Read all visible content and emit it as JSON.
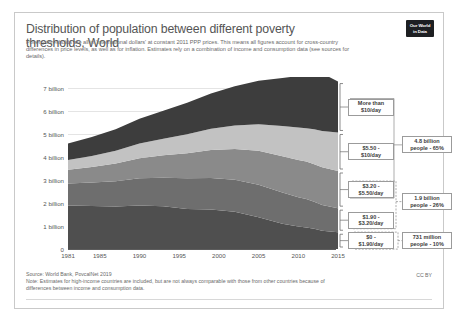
{
  "header": {
    "title": "Distribution of population between different poverty thresholds, World",
    "subtitle": "Poverty thresholds are all in 'international dollars' at constant 2011 PPP prices. This means all figures account for cross-country differences in price levels, as well as for inflation. Estimates rely on a combination of income and consumption data (see sources for details).",
    "logo_line1": "Our World",
    "logo_line2": "in Data"
  },
  "footer": {
    "source": "Source: World Bank, PovcalNet 2019",
    "note": "Note: Estimates for high-income countries are included, but are not always comparable with those from other countries because of differences between income and consumption data.",
    "license": "CC BY"
  },
  "band_labels": [
    {
      "line1": "More than",
      "line2": "$10/day"
    },
    {
      "line1": "$5.50 -",
      "line2": "$10/day"
    },
    {
      "line1": "$3.20 -",
      "line2": "$5.50/day"
    },
    {
      "line1": "$1.90 -",
      "line2": "$3.20/day"
    },
    {
      "line1": "$0 -",
      "line2": "$1.90/day"
    }
  ],
  "aggregate_labels": [
    {
      "line1": "4.8 billion",
      "line2": "people - 65%"
    },
    {
      "line1": "1.9 billion",
      "line2": "people - 26%"
    },
    {
      "line1": "731 million",
      "line2": "people - 10%"
    }
  ],
  "colors": {
    "band_more_than_10": "#3d3d3d",
    "band_5_50_to_10": "#c2c2c2",
    "band_3_20_to_5_50": "#8a8a8a",
    "band_1_90_to_3_20": "#6e6e6e",
    "band_0_to_1_90": "#4f4f4f",
    "grid": "#e4e4e4",
    "axis": "#5c5c5c",
    "text": "#555555"
  },
  "chart_data": {
    "type": "area",
    "title": "Distribution of population between different poverty thresholds, World",
    "xlabel": "",
    "ylabel": "",
    "stacked": true,
    "grid": true,
    "legend_position": "right-annotations",
    "xlim": [
      1981,
      2015
    ],
    "ylim": [
      0,
      7500000000
    ],
    "ytick_labels": [
      "0",
      "1 billion",
      "2 billion",
      "3 billion",
      "4 billion",
      "5 billion",
      "6 billion",
      "7 billion"
    ],
    "ytick_values": [
      0,
      1000000000,
      2000000000,
      3000000000,
      4000000000,
      5000000000,
      6000000000,
      7000000000
    ],
    "xtick_labels": [
      "1981",
      "1985",
      "1990",
      "1995",
      "2000",
      "2005",
      "2010",
      "2015"
    ],
    "xtick_values": [
      1981,
      1985,
      1990,
      1995,
      2000,
      2005,
      2010,
      2015
    ],
    "x": [
      1981,
      1984,
      1987,
      1990,
      1993,
      1996,
      1999,
      2002,
      2005,
      2008,
      2010,
      2011,
      2012,
      2013,
      2015
    ],
    "series": [
      {
        "name": "$0 - $1.90/day",
        "values_billions": [
          1.9,
          1.88,
          1.85,
          1.9,
          1.86,
          1.74,
          1.72,
          1.62,
          1.38,
          1.1,
          0.98,
          0.94,
          0.88,
          0.8,
          0.731
        ]
      },
      {
        "name": "$1.90 - $3.20/day",
        "values_billions": [
          0.96,
          1.02,
          1.1,
          1.18,
          1.25,
          1.34,
          1.38,
          1.4,
          1.42,
          1.36,
          1.28,
          1.24,
          1.18,
          1.12,
          1.05
        ]
      },
      {
        "name": "$3.20 - $5.50/day",
        "values_billions": [
          0.6,
          0.68,
          0.78,
          0.88,
          0.98,
          1.1,
          1.22,
          1.34,
          1.48,
          1.58,
          1.62,
          1.63,
          1.64,
          1.64,
          1.62
        ]
      },
      {
        "name": "$5.50 - $10/day",
        "values_billions": [
          0.42,
          0.48,
          0.55,
          0.64,
          0.72,
          0.82,
          0.92,
          1.02,
          1.16,
          1.32,
          1.42,
          1.46,
          1.52,
          1.58,
          1.68
        ]
      },
      {
        "name": "More than $10/day",
        "values_billions": [
          0.72,
          0.82,
          0.94,
          1.08,
          1.22,
          1.38,
          1.54,
          1.72,
          1.9,
          2.1,
          2.24,
          2.32,
          2.42,
          2.52,
          2.22
        ]
      }
    ],
    "totals_billions": [
      4.6,
      4.88,
      5.22,
      5.68,
      6.03,
      6.38,
      6.78,
      7.1,
      7.34,
      7.46,
      7.54,
      7.59,
      7.64,
      7.66,
      7.3
    ],
    "annotations": [
      {
        "text": "4.8 billion people - 65%",
        "covers": [
          "More than $10/day",
          "$5.50 - $10/day",
          "$3.20 - $5.50/day"
        ]
      },
      {
        "text": "1.9 billion people - 26%",
        "covers": [
          "$1.90 - $3.20/day",
          "$3.20 - $5.50/day"
        ]
      },
      {
        "text": "731 million people - 10%",
        "covers": [
          "$0 - $1.90/day"
        ]
      }
    ]
  }
}
